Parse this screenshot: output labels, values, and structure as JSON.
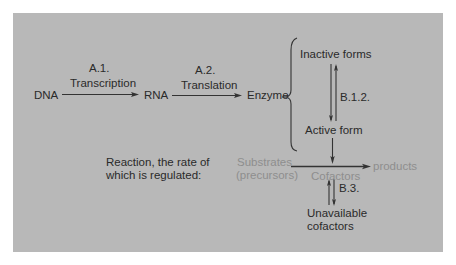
{
  "diagram": {
    "nodes": {
      "dna": "DNA",
      "rna": "RNA",
      "enzyme": "Enzyme",
      "inactive": "Inactive forms",
      "active": "Active form",
      "substrates_line1": "Substrates",
      "substrates_line2": "(precursors)",
      "cofactors": "Cofactors",
      "products": "products",
      "unavailable_line1": "Unavailable",
      "unavailable_line2": "cofactors"
    },
    "edges": {
      "a1_label": "A.1.",
      "a1_caption": "Transcription",
      "a2_label": "A.2.",
      "a2_caption": "Translation",
      "b12_label": "B.1.2.",
      "b3_label": "B.3."
    },
    "note": {
      "line1": "Reaction, the rate of",
      "line2": "which is regulated:"
    },
    "colors": {
      "panel": "#b8b8b8",
      "text": "#2a2a2a",
      "muted_text": "#8e8e8e",
      "background": "#ffffff"
    }
  }
}
